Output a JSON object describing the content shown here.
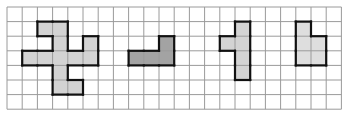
{
  "grid": {
    "left": 7,
    "top": 7,
    "cols": 22,
    "rows": 7,
    "cell_w": 15.2,
    "cell_h": 14.6,
    "line_color": "#9a9a9a"
  },
  "shapes": [
    {
      "name": "shape-plus-pinwheel",
      "fill": "#d3d3d3",
      "cells": [
        [
          2,
          1
        ],
        [
          3,
          1
        ],
        [
          3,
          2
        ],
        [
          5,
          2
        ],
        [
          1,
          3
        ],
        [
          2,
          3
        ],
        [
          3,
          3
        ],
        [
          4,
          3
        ],
        [
          5,
          3
        ],
        [
          3,
          4
        ],
        [
          3,
          5
        ],
        [
          4,
          5
        ]
      ]
    },
    {
      "name": "shape-l-dark",
      "fill": "#a3a3a3",
      "cells": [
        [
          10,
          2
        ],
        [
          8,
          3
        ],
        [
          9,
          3
        ],
        [
          10,
          3
        ]
      ]
    },
    {
      "name": "shape-t-vertical",
      "fill": "#d3d3d3",
      "cells": [
        [
          15,
          1
        ],
        [
          14,
          2
        ],
        [
          15,
          2
        ],
        [
          15,
          3
        ],
        [
          15,
          4
        ]
      ]
    },
    {
      "name": "shape-p-small",
      "fill": "#dedede",
      "cells": [
        [
          19,
          1
        ],
        [
          19,
          2
        ],
        [
          20,
          2
        ],
        [
          19,
          3
        ],
        [
          20,
          3
        ]
      ]
    }
  ]
}
